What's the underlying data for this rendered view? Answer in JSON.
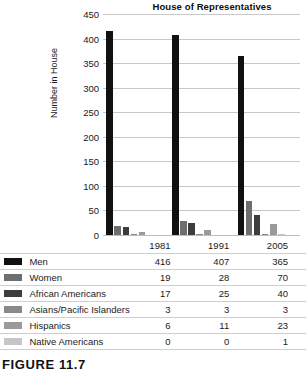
{
  "figure": {
    "caption": "FIGURE 11.7"
  },
  "chart_data": {
    "type": "bar",
    "title": "House of Representatives",
    "xlabel": "",
    "ylabel": "Number in House",
    "categories": [
      "1981",
      "1991",
      "2005"
    ],
    "ylim": [
      0,
      450
    ],
    "yticks": [
      0,
      50,
      100,
      150,
      200,
      250,
      300,
      350,
      400,
      450
    ],
    "grid": true,
    "legend_position": "bottom-table",
    "series": [
      {
        "name": "Men",
        "color": "#111111",
        "values": [
          416,
          407,
          365
        ]
      },
      {
        "name": "Women",
        "color": "#6e6e6e",
        "values": [
          19,
          28,
          70
        ]
      },
      {
        "name": "African Americans",
        "color": "#3d3d3d",
        "values": [
          17,
          25,
          40
        ]
      },
      {
        "name": "Asians/Pacific Islanders",
        "color": "#8a8a8a",
        "values": [
          3,
          3,
          3
        ]
      },
      {
        "name": "Hispanics",
        "color": "#9a9a9a",
        "values": [
          6,
          11,
          23
        ]
      },
      {
        "name": "Native Americans",
        "color": "#c6c6c6",
        "values": [
          0,
          0,
          1
        ]
      }
    ]
  },
  "table": {
    "year_headers": [
      "1981",
      "1991",
      "2005"
    ]
  }
}
